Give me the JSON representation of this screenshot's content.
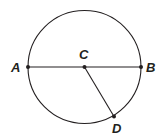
{
  "diagram": {
    "type": "circle-geometry",
    "circle": {
      "cx": 84.5,
      "cy": 67,
      "r": 56.5,
      "stroke": "#231f20"
    },
    "points": [
      {
        "name": "A",
        "x": 28,
        "y": 67,
        "label_x": 14,
        "label_y": 72
      },
      {
        "name": "B",
        "x": 141,
        "y": 67,
        "label_x": 145,
        "label_y": 72
      },
      {
        "name": "C",
        "x": 84.5,
        "y": 67,
        "label_x": 79,
        "label_y": 59
      },
      {
        "name": "D",
        "x": 114,
        "y": 116.5,
        "label_x": 112,
        "label_y": 133
      }
    ],
    "segments": [
      {
        "from": "A",
        "to": "B",
        "label": "diameter AB"
      },
      {
        "from": "C",
        "to": "D",
        "label": "radius CD"
      }
    ],
    "labels": {
      "A": "A",
      "B": "B",
      "C": "C",
      "D": "D"
    }
  }
}
